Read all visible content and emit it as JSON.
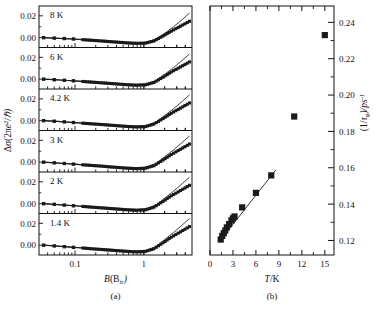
{
  "figure": {
    "panel_a_caption": "(a)",
    "panel_b_caption": "(b)"
  },
  "chart_data": [
    {
      "type": "line",
      "id": "panel-a",
      "title": "",
      "xlabel": "B(Btr)",
      "xlabel_parts": {
        "italic": "B",
        "paren_open": "(B",
        "sub": "tr",
        "paren_close": ")"
      },
      "ylabel": "Δσ(2πe²/ℏ)",
      "xscale": "log",
      "xlim": [
        0.03,
        5
      ],
      "xticks": [
        0.1,
        1
      ],
      "xticklabels": [
        "0.1",
        "1"
      ],
      "ylim": [
        -0.009,
        0.029
      ],
      "yticks": [
        0.0,
        0.02
      ],
      "yticklabels": [
        "0.00",
        "0.02"
      ],
      "grid": false,
      "legend_position": "inside-top-left",
      "subpanels": [
        {
          "label": "8 K",
          "series": [
            {
              "name": "data",
              "marker": "square",
              "x": [
                0.035,
                0.05,
                0.07,
                0.095,
                0.13,
                0.175,
                0.24,
                0.32,
                0.43,
                0.58,
                0.78,
                1.05,
                1.4,
                1.9,
                2.5,
                3.4,
                4.6
              ],
              "y": [
                0.0,
                -0.0004,
                -0.0008,
                -0.0012,
                -0.0018,
                -0.0024,
                -0.003,
                -0.0036,
                -0.0042,
                -0.0048,
                -0.0052,
                -0.005,
                -0.003,
                0.0015,
                0.006,
                0.0105,
                0.015
              ]
            },
            {
              "name": "fit",
              "marker": "none",
              "x": [
                0.035,
                0.1,
                0.3,
                0.7,
                1.1,
                1.5,
                2.0,
                2.7,
                3.6,
                4.6
              ],
              "y": [
                0.0,
                -0.0014,
                -0.0034,
                -0.005,
                -0.0042,
                -0.0012,
                0.004,
                0.01,
                0.0165,
                0.0225
              ]
            }
          ]
        },
        {
          "label": "6 K",
          "series": [
            {
              "name": "data",
              "marker": "square",
              "x": [
                0.035,
                0.05,
                0.07,
                0.095,
                0.13,
                0.175,
                0.24,
                0.32,
                0.43,
                0.58,
                0.78,
                1.05,
                1.4,
                1.9,
                2.5,
                3.4,
                4.6
              ],
              "y": [
                0.0,
                -0.0005,
                -0.001,
                -0.0015,
                -0.0021,
                -0.0027,
                -0.0033,
                -0.0039,
                -0.0045,
                -0.0051,
                -0.0055,
                -0.0052,
                -0.003,
                0.0018,
                0.0066,
                0.0112,
                0.0158
              ]
            },
            {
              "name": "fit",
              "marker": "none",
              "x": [
                0.035,
                0.1,
                0.3,
                0.7,
                1.1,
                1.5,
                2.0,
                2.7,
                3.6,
                4.6
              ],
              "y": [
                0.0,
                -0.0016,
                -0.0037,
                -0.0053,
                -0.0044,
                -0.0012,
                0.0044,
                0.0106,
                0.0172,
                0.0232
              ]
            }
          ]
        },
        {
          "label": "4.2 K",
          "series": [
            {
              "name": "data",
              "marker": "square",
              "x": [
                0.035,
                0.05,
                0.07,
                0.095,
                0.13,
                0.175,
                0.24,
                0.32,
                0.43,
                0.58,
                0.78,
                1.05,
                1.4,
                1.9,
                2.5,
                3.4,
                4.6
              ],
              "y": [
                0.0,
                -0.0005,
                -0.0011,
                -0.0017,
                -0.0023,
                -0.0029,
                -0.0035,
                -0.0041,
                -0.0047,
                -0.0053,
                -0.0057,
                -0.0054,
                -0.0031,
                0.0019,
                0.0068,
                0.0115,
                0.0162
              ]
            },
            {
              "name": "fit",
              "marker": "none",
              "x": [
                0.035,
                0.1,
                0.3,
                0.7,
                1.1,
                1.5,
                2.0,
                2.7,
                3.6,
                4.6
              ],
              "y": [
                0.0,
                -0.0017,
                -0.0039,
                -0.0055,
                -0.0045,
                -0.0012,
                0.0046,
                0.011,
                0.0176,
                0.0236
              ]
            }
          ]
        },
        {
          "label": "3 K",
          "series": [
            {
              "name": "data",
              "marker": "square",
              "x": [
                0.035,
                0.05,
                0.07,
                0.095,
                0.13,
                0.175,
                0.24,
                0.32,
                0.43,
                0.58,
                0.78,
                1.05,
                1.4,
                1.9,
                2.5,
                3.4,
                4.6
              ],
              "y": [
                0.0,
                -0.0006,
                -0.0012,
                -0.0018,
                -0.0024,
                -0.003,
                -0.0036,
                -0.0043,
                -0.0049,
                -0.0055,
                -0.0059,
                -0.0055,
                -0.0032,
                0.002,
                0.007,
                0.0118,
                0.0166
              ]
            },
            {
              "name": "fit",
              "marker": "none",
              "x": [
                0.035,
                0.1,
                0.3,
                0.7,
                1.1,
                1.5,
                2.0,
                2.7,
                3.6,
                4.6
              ],
              "y": [
                0.0,
                -0.0018,
                -0.0041,
                -0.0057,
                -0.0046,
                -0.0012,
                0.0048,
                0.0113,
                0.018,
                0.024
              ]
            }
          ]
        },
        {
          "label": "2 K",
          "series": [
            {
              "name": "data",
              "marker": "square",
              "x": [
                0.035,
                0.05,
                0.07,
                0.095,
                0.13,
                0.175,
                0.24,
                0.32,
                0.43,
                0.58,
                0.78,
                1.05,
                1.4,
                1.9,
                2.5,
                3.4,
                4.6
              ],
              "y": [
                0.0,
                -0.0006,
                -0.0013,
                -0.0019,
                -0.0025,
                -0.0032,
                -0.0038,
                -0.0044,
                -0.005,
                -0.0056,
                -0.006,
                -0.0056,
                -0.0032,
                0.0021,
                0.0072,
                0.012,
                0.0168
              ]
            },
            {
              "name": "fit",
              "marker": "none",
              "x": [
                0.035,
                0.1,
                0.3,
                0.7,
                1.1,
                1.5,
                2.0,
                2.7,
                3.6,
                4.6
              ],
              "y": [
                0.0,
                -0.0019,
                -0.0042,
                -0.0058,
                -0.0047,
                -0.0012,
                0.0049,
                0.0115,
                0.0182,
                0.0243
              ]
            }
          ]
        },
        {
          "label": "1.4 K",
          "series": [
            {
              "name": "data",
              "marker": "square",
              "x": [
                0.035,
                0.05,
                0.07,
                0.095,
                0.13,
                0.175,
                0.24,
                0.32,
                0.43,
                0.58,
                0.78,
                1.05,
                1.4,
                1.9,
                2.5,
                3.4,
                4.6
              ],
              "y": [
                0.0,
                -0.0007,
                -0.0014,
                -0.002,
                -0.0026,
                -0.0033,
                -0.0039,
                -0.0045,
                -0.0051,
                -0.0057,
                -0.0061,
                -0.0057,
                -0.0033,
                0.0022,
                0.0073,
                0.0122,
                0.017
              ]
            },
            {
              "name": "fit",
              "marker": "none",
              "x": [
                0.035,
                0.1,
                0.3,
                0.7,
                1.1,
                1.5,
                2.0,
                2.7,
                3.6,
                4.6
              ],
              "y": [
                0.0,
                -0.002,
                -0.0043,
                -0.0059,
                -0.0048,
                -0.0012,
                0.005,
                0.0116,
                0.0184,
                0.0245
              ]
            }
          ]
        }
      ]
    },
    {
      "type": "scatter",
      "id": "panel-b",
      "title": "",
      "xlabel": "T/K",
      "ylabel": "(1/τφ)/ps⁻¹",
      "ylabel_parts": {
        "open": "(1/",
        "tau": "τ",
        "sub": "φ",
        "close": ")/ps",
        "sup": "-1"
      },
      "xscale": "linear",
      "xlim": [
        0,
        16.2
      ],
      "xticks": [
        0,
        3,
        6,
        9,
        12,
        15
      ],
      "xticklabels": [
        "0",
        "3",
        "6",
        "9",
        "12",
        "15"
      ],
      "yaxis_side": "right",
      "ylim": [
        0.112,
        0.249
      ],
      "yticks": [
        0.12,
        0.14,
        0.16,
        0.18,
        0.2,
        0.22,
        0.24
      ],
      "yticklabels": [
        "0.12",
        "0.14",
        "0.16",
        "0.18",
        "0.20",
        "0.22",
        "0.24"
      ],
      "grid": false,
      "series": [
        {
          "name": "dephasing rate",
          "marker": "square",
          "x": [
            1.4,
            1.6,
            1.8,
            2.0,
            2.2,
            2.5,
            2.8,
            3.0,
            3.2,
            4.2,
            6.0,
            8.0,
            11.0,
            15.0
          ],
          "y": [
            0.1205,
            0.1225,
            0.124,
            0.1255,
            0.1272,
            0.129,
            0.131,
            0.1322,
            0.1332,
            0.1382,
            0.1462,
            0.1558,
            0.1882,
            0.233
          ]
        },
        {
          "name": "linear fit",
          "marker": "none",
          "x": [
            1.3,
            8.6
          ],
          "y": [
            0.1198,
            0.1588
          ]
        }
      ]
    }
  ]
}
